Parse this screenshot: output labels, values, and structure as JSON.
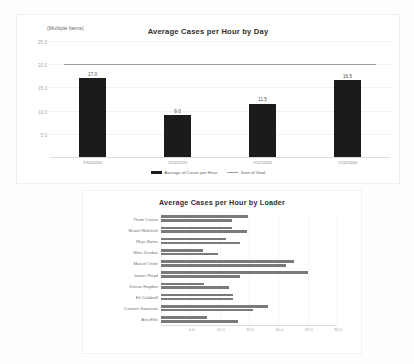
{
  "chart_data": [
    {
      "type": "bar",
      "title": "Average Cases per Hour by Day",
      "filter_label": "(Multiple Items)",
      "categories": [
        "7/10/2020",
        "7/11/2020",
        "7/12/2020",
        "7/14/2020"
      ],
      "values": [
        17.0,
        9.0,
        11.5,
        16.5
      ],
      "value_labels": [
        "17.0",
        "9.0",
        "11.5",
        "16.5"
      ],
      "goal_series": {
        "name": "Sum of Goal",
        "value": 20.0
      },
      "series": [
        {
          "name": "Average of Cases per Hour",
          "values": [
            17.0,
            9.0,
            11.5,
            16.5
          ]
        },
        {
          "name": "Sum of Goal",
          "values": [
            20.0,
            20.0,
            20.0,
            20.0
          ]
        }
      ],
      "legend": [
        {
          "label": "Average of Cases per Hour",
          "marker": "bar",
          "color": "#1b1b1b"
        },
        {
          "label": "Sum of Goal",
          "marker": "line",
          "color": "#9d9d9d"
        }
      ],
      "yticks": [
        "25.0",
        "20.0",
        "15.0",
        "10.0",
        "5.0"
      ],
      "ytick_values": [
        25.0,
        20.0,
        15.0,
        10.0,
        5.0
      ],
      "ylim": [
        0,
        25
      ],
      "xlabel": "",
      "ylabel": "",
      "grid": true,
      "legend_position": "bottom"
    },
    {
      "type": "bar",
      "orientation": "horizontal",
      "title": "Average Cases per Hour by Loader",
      "categories": [
        "Thom Castro",
        "Shanti Wolchek",
        "Rhys Bates",
        "Niles Dunbar",
        "Marcel Orion",
        "James Floyd",
        "Kieran Hayden",
        "Eli Caldwell",
        "Carmen Swanson",
        "Aria Ellis"
      ],
      "series": [
        {
          "name": "Average of Cases per Hour",
          "values": [
            14.8,
            12.1,
            11.0,
            7.2,
            22.6,
            25.1,
            7.3,
            12.2,
            18.3,
            7.8
          ]
        },
        {
          "name": "Sum of Goal",
          "values": [
            12.1,
            14.6,
            13.5,
            9.8,
            21.3,
            13.4,
            11.6,
            12.2,
            15.6,
            13.1
          ]
        }
      ],
      "xticks": [
        "-",
        "5.0",
        "10.0",
        "15.0",
        "20.0",
        "25.0",
        "30.0"
      ],
      "xtick_values": [
        0,
        5,
        10,
        15,
        20,
        25,
        30
      ],
      "xlim": [
        0,
        30
      ],
      "xlabel": "",
      "ylabel": "",
      "grid": true,
      "legend_position": "none"
    }
  ],
  "colors": {
    "bar": "#1b1b1b",
    "goal_line": "#9d9d9d",
    "loader_bar": "#7a7a7a",
    "axis": "#dcdcdc",
    "grid": "#f2f2f2",
    "background": "#ffffff"
  }
}
